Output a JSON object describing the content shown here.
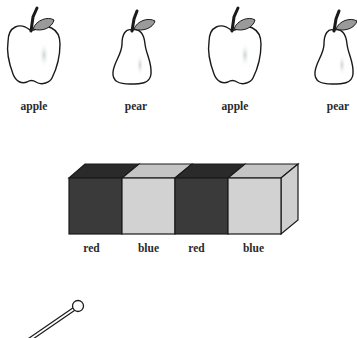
{
  "fruit_row": {
    "items": [
      {
        "kind": "apple",
        "label": "apple"
      },
      {
        "kind": "pear",
        "label": "pear"
      },
      {
        "kind": "apple",
        "label": "apple"
      },
      {
        "kind": "pear",
        "label": "pear"
      }
    ]
  },
  "cube_row": {
    "cubes": [
      {
        "label": "red",
        "shade": "#3a3a3a"
      },
      {
        "label": "blue",
        "shade": "#d2d2d2"
      },
      {
        "label": "red",
        "shade": "#3a3a3a"
      },
      {
        "label": "blue",
        "shade": "#d2d2d2"
      }
    ]
  },
  "pin": {
    "icon": "pin-icon"
  },
  "colors": {
    "outline": "#1a1a1a",
    "leaf": "#9a9a9a",
    "dark_cube": "#3a3a3a",
    "dark_cube_top": "#2a2a2a",
    "light_cube": "#d2d2d2",
    "light_cube_top": "#c4c4c4",
    "light_cube_side": "#cfcfcf"
  }
}
